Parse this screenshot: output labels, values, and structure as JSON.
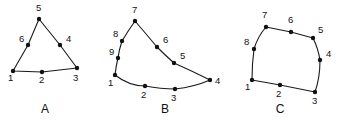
{
  "figure": {
    "background_color": "#ffffff",
    "stroke_color": "#1a1a1a",
    "vertex_color": "#111111",
    "width": 344,
    "height": 123,
    "shapes": [
      {
        "caption": "A",
        "caption_pos": [
          45,
          113
        ],
        "closed": true,
        "curved": false,
        "path": "M 13 71 L 42 72 L 77 68 L 60 45 L 39 19 L 28 45 Z",
        "vertices": [
          {
            "label": "1",
            "x": 13,
            "y": 71,
            "lx": 8,
            "ly": 81
          },
          {
            "label": "2",
            "x": 42,
            "y": 72,
            "lx": 39,
            "ly": 83
          },
          {
            "label": "3",
            "x": 77,
            "y": 68,
            "lx": 73,
            "ly": 81
          },
          {
            "label": "4",
            "x": 60,
            "y": 45,
            "lx": 66,
            "ly": 42
          },
          {
            "label": "5",
            "x": 39,
            "y": 19,
            "lx": 36,
            "ly": 11
          },
          {
            "label": "6",
            "x": 28,
            "y": 45,
            "lx": 19,
            "ly": 42
          }
        ]
      },
      {
        "caption": "B",
        "caption_pos": [
          165,
          113
        ],
        "closed": true,
        "curved": true,
        "path": "M 115 75 Q 129 86 145 86 Q 161 89 175 89 Q 194 87 210 80 Q 192 71 174 63 Q 165 55 157 47 Q 147 35 135 21 Q 128 31 122 41 Q 119 50 118 58 Q 116 66 115 75 Z",
        "vertices": [
          {
            "label": "1",
            "x": 115,
            "y": 75,
            "lx": 108,
            "ly": 86
          },
          {
            "label": "2",
            "x": 145,
            "y": 86,
            "lx": 141,
            "ly": 98
          },
          {
            "label": "3",
            "x": 175,
            "y": 89,
            "lx": 171,
            "ly": 101
          },
          {
            "label": "4",
            "x": 210,
            "y": 80,
            "lx": 215,
            "ly": 84
          },
          {
            "label": "5",
            "x": 174,
            "y": 63,
            "lx": 180,
            "ly": 59
          },
          {
            "label": "6",
            "x": 157,
            "y": 47,
            "lx": 163,
            "ly": 43
          },
          {
            "label": "7",
            "x": 135,
            "y": 21,
            "lx": 132,
            "ly": 13
          },
          {
            "label": "8",
            "x": 122,
            "y": 41,
            "lx": 113,
            "ly": 37
          },
          {
            "label": "9",
            "x": 118,
            "y": 58,
            "lx": 109,
            "ly": 55
          }
        ]
      },
      {
        "caption": "C",
        "caption_pos": [
          280,
          113
        ],
        "closed": true,
        "curved": true,
        "path": "M 252 80 L 280 85 L 315 92 Q 320 78 320 60 Q 318 48 313 38 L 291 32 L 266 27 Q 258 36 254 49 Q 252 64 252 80 Z",
        "vertices": [
          {
            "label": "1",
            "x": 252,
            "y": 80,
            "lx": 245,
            "ly": 90
          },
          {
            "label": "2",
            "x": 280,
            "y": 85,
            "lx": 276,
            "ly": 97
          },
          {
            "label": "3",
            "x": 315,
            "y": 92,
            "lx": 312,
            "ly": 104
          },
          {
            "label": "4",
            "x": 320,
            "y": 60,
            "lx": 326,
            "ly": 57
          },
          {
            "label": "5",
            "x": 313,
            "y": 38,
            "lx": 318,
            "ly": 33
          },
          {
            "label": "6",
            "x": 291,
            "y": 32,
            "lx": 288,
            "ly": 23
          },
          {
            "label": "7",
            "x": 266,
            "y": 27,
            "lx": 262,
            "ly": 18
          },
          {
            "label": "8",
            "x": 254,
            "y": 49,
            "lx": 244,
            "ly": 45
          }
        ]
      }
    ]
  }
}
